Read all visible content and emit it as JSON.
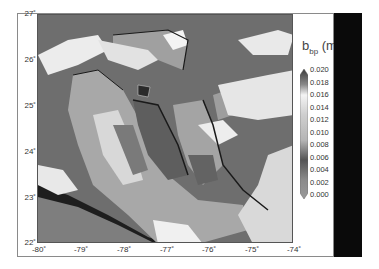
{
  "map": {
    "type": "satellite-raster-map",
    "region": "Bahamas / Great Bahama Bank",
    "x_axis": {
      "label": "",
      "ticks": [
        "-80˚",
        "-79˚",
        "-78˚",
        "-77˚",
        "-76˚",
        "-75˚",
        "-74˚"
      ],
      "range": [
        -80,
        -74
      ]
    },
    "y_axis": {
      "label": "",
      "ticks": [
        "27˚",
        "26˚",
        "25˚",
        "24˚",
        "23˚",
        "22˚"
      ],
      "range": [
        22,
        27
      ]
    },
    "colormap": "grayscale",
    "features": [
      "clouds (white)",
      "shallow bank (light gray)",
      "deep water (dark gray)",
      "land/coast (black outlines)"
    ]
  },
  "colorbar": {
    "title_main": "b",
    "title_sub": "bp",
    "title_rest": " (m",
    "ticks": [
      "0.020",
      "0.018",
      "0.016",
      "0.014",
      "0.012",
      "0.010",
      "0.008",
      "0.006",
      "0.004",
      "0.002",
      "0.000"
    ],
    "range": [
      0.0,
      0.02
    ],
    "extend": "both"
  },
  "colors": {
    "deep_water": "#6a6a6a",
    "bank": "#a8a8a8",
    "cloud": "#f2f2f2",
    "land": "#1e1e1e",
    "mask_bar": "#0a0a0a"
  }
}
